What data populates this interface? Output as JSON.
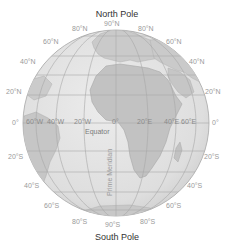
{
  "title_top": "North Pole",
  "title_bottom": "South Pole",
  "equator_label": "Equator",
  "prime_meridian_label": "Prime Meridian",
  "colors": {
    "ocean": "#e4e4e4",
    "land": "#c4c4c4",
    "grid": "#a8a8a8",
    "outline": "#b8b8b8",
    "label": "#9a9a9a"
  },
  "latitude_labels": {
    "left": [
      "80°N",
      "60°N",
      "40°N",
      "20°N",
      "0°",
      "20°S",
      "40°S",
      "60°S",
      "80°S"
    ],
    "right": [
      "80°N",
      "60°N",
      "40°N",
      "20°N",
      "0°",
      "20°S",
      "40°S",
      "60°S",
      "80°S"
    ],
    "top_center": "90°N",
    "bottom_center": "90°S"
  },
  "longitude_labels": [
    "60°W",
    "40°W",
    "20°W",
    "0°",
    "20°E",
    "40°E",
    "60°E"
  ]
}
